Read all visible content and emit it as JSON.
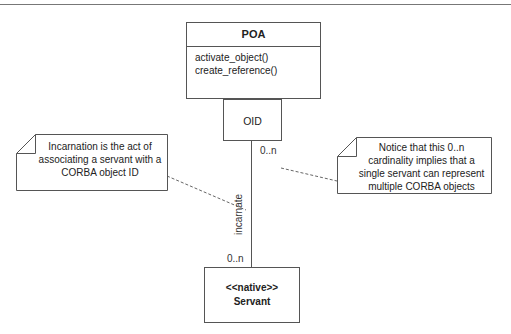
{
  "diagram": {
    "type": "UML class diagram",
    "poa": {
      "name": "POA",
      "operations": [
        "activate_object()",
        "create_reference()"
      ]
    },
    "qualifier": {
      "label": "OID"
    },
    "servant": {
      "stereotype": "<<native>>",
      "name": "Servant"
    },
    "association": {
      "label": "incarnate",
      "multiplicity_top": "0..n",
      "multiplicity_bottom": "0..n"
    },
    "notes": [
      {
        "text": "Incarnation is the act of associating a servant with a CORBA object ID"
      },
      {
        "text": "Notice that this 0..n cardinality implies that a single servant can represent multiple CORBA objects"
      }
    ],
    "colors": {
      "line": "#555555",
      "background": "#ffffff"
    }
  }
}
